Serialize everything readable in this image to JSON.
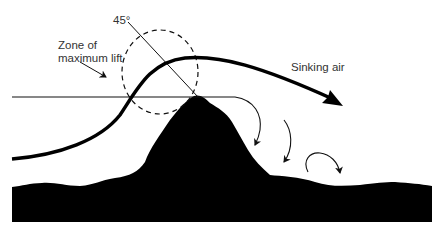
{
  "diagram": {
    "type": "ridge lift illustration",
    "labels": {
      "angle": "45°",
      "zone_line1": "Zone of",
      "zone_line2": "maximum lift",
      "sinking": "Sinking air"
    },
    "colors": {
      "terrain": "#000000",
      "lines": "#111111",
      "text": "#333333",
      "background": "#ffffff"
    }
  }
}
